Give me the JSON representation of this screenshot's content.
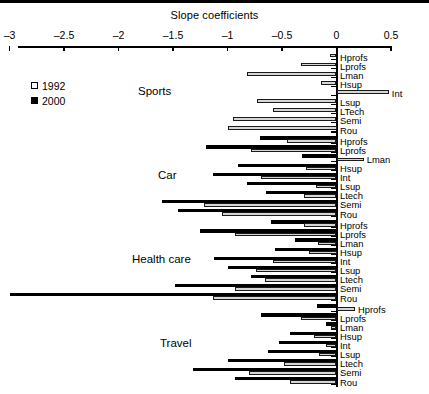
{
  "figure": {
    "axis_title": "Slope coefficients",
    "x_ticks": [
      {
        "value": -3,
        "label": "–3"
      },
      {
        "value": -2.5,
        "label": "–2.5"
      },
      {
        "value": -2,
        "label": "–2"
      },
      {
        "value": -1.5,
        "label": "–1.5"
      },
      {
        "value": -1,
        "label": "–1"
      },
      {
        "value": -0.5,
        "label": "–0.5"
      },
      {
        "value": 0,
        "label": "0"
      },
      {
        "value": 0.5,
        "label": "0.5"
      }
    ]
  },
  "legend": {
    "items": [
      {
        "label": "1992",
        "swatch": "open",
        "color": "#ffffff"
      },
      {
        "label": "2000",
        "swatch": "filled",
        "color": "#000000"
      }
    ]
  },
  "chart_data": {
    "type": "bar",
    "orientation": "horizontal",
    "title": "Slope coefficients",
    "xlabel": "Slope coefficients",
    "ylabel": "",
    "xlim": [
      -3,
      0.5
    ],
    "grid": false,
    "legend_position": "left-upper",
    "series_names": [
      "1992",
      "2000"
    ],
    "series_colors": {
      "1992": "#ffffff",
      "2000": "#000000"
    },
    "categories": [
      "Hprofs",
      "Lprofs",
      "Lman",
      "Hsup",
      "Int",
      "Lsup",
      "Ltech",
      "Semi",
      "Rou"
    ],
    "groups": [
      {
        "name": "Sports",
        "rows": [
          {
            "label": "Hprofs",
            "v1992": -0.06,
            "v2000": null
          },
          {
            "label": "Lprofs",
            "v1992": -0.33,
            "v2000": null
          },
          {
            "label": "Lman",
            "v1992": -0.82,
            "v2000": null
          },
          {
            "label": "Hsup",
            "v1992": -0.14,
            "v2000": null
          },
          {
            "label": "Int",
            "v1992": 0.48,
            "v2000": null
          },
          {
            "label": "Lsup",
            "v1992": -0.73,
            "v2000": null
          },
          {
            "label": "LTech",
            "v1992": -0.58,
            "v2000": null
          },
          {
            "label": "Semi",
            "v1992": -0.95,
            "v2000": null
          },
          {
            "label": "Rou",
            "v1992": -1.0,
            "v2000": null
          }
        ]
      },
      {
        "name": "Car",
        "rows": [
          {
            "label": "Hprofs",
            "v1992": -0.45,
            "v2000": -0.7
          },
          {
            "label": "Lprofs",
            "v1992": -0.78,
            "v2000": -1.2
          },
          {
            "label": "Lman",
            "v1992": 0.25,
            "v2000": -0.32
          },
          {
            "label": "Hsup",
            "v1992": -0.28,
            "v2000": -0.9
          },
          {
            "label": "Int",
            "v1992": -0.69,
            "v2000": -1.13
          },
          {
            "label": "Lsup",
            "v1992": -0.19,
            "v2000": -0.82
          },
          {
            "label": "Ltech",
            "v1992": -0.3,
            "v2000": -0.65
          },
          {
            "label": "Semi",
            "v1992": -1.22,
            "v2000": -1.6
          },
          {
            "label": "Rou",
            "v1992": -1.05,
            "v2000": -1.45
          }
        ]
      },
      {
        "name": "Health care",
        "rows": [
          {
            "label": "Hprofs",
            "v1992": -0.3,
            "v2000": -0.6
          },
          {
            "label": "Lprofs",
            "v1992": -0.93,
            "v2000": -1.25
          },
          {
            "label": "Lman",
            "v1992": -0.17,
            "v2000": -0.38
          },
          {
            "label": "Hsup",
            "v1992": -0.25,
            "v2000": -0.56
          },
          {
            "label": "Int",
            "v1992": -0.58,
            "v2000": -1.12
          },
          {
            "label": "Lsup",
            "v1992": -0.74,
            "v2000": -1.0
          },
          {
            "label": "Ltech",
            "v1992": -0.66,
            "v2000": -0.78
          },
          {
            "label": "Semi",
            "v1992": -0.93,
            "v2000": -1.48
          },
          {
            "label": "Rou",
            "v1992": -1.13,
            "v2000": -3.0
          }
        ]
      },
      {
        "name": "Travel",
        "rows": [
          {
            "label": "Hprofs",
            "v1992": 0.17,
            "v2000": -0.18
          },
          {
            "label": "Lprofs",
            "v1992": -0.33,
            "v2000": -0.69
          },
          {
            "label": "Lman",
            "v1992": -0.05,
            "v2000": -0.1
          },
          {
            "label": "Hsup",
            "v1992": -0.21,
            "v2000": -0.43
          },
          {
            "label": "Int",
            "v1992": -0.1,
            "v2000": -0.53
          },
          {
            "label": "Lsup",
            "v1992": -0.16,
            "v2000": -0.63
          },
          {
            "label": "Ltech",
            "v1992": -0.48,
            "v2000": -1.0
          },
          {
            "label": "Semi",
            "v1992": -0.8,
            "v2000": -1.32
          },
          {
            "label": "Rou",
            "v1992": -0.43,
            "v2000": -0.93
          }
        ]
      }
    ]
  }
}
